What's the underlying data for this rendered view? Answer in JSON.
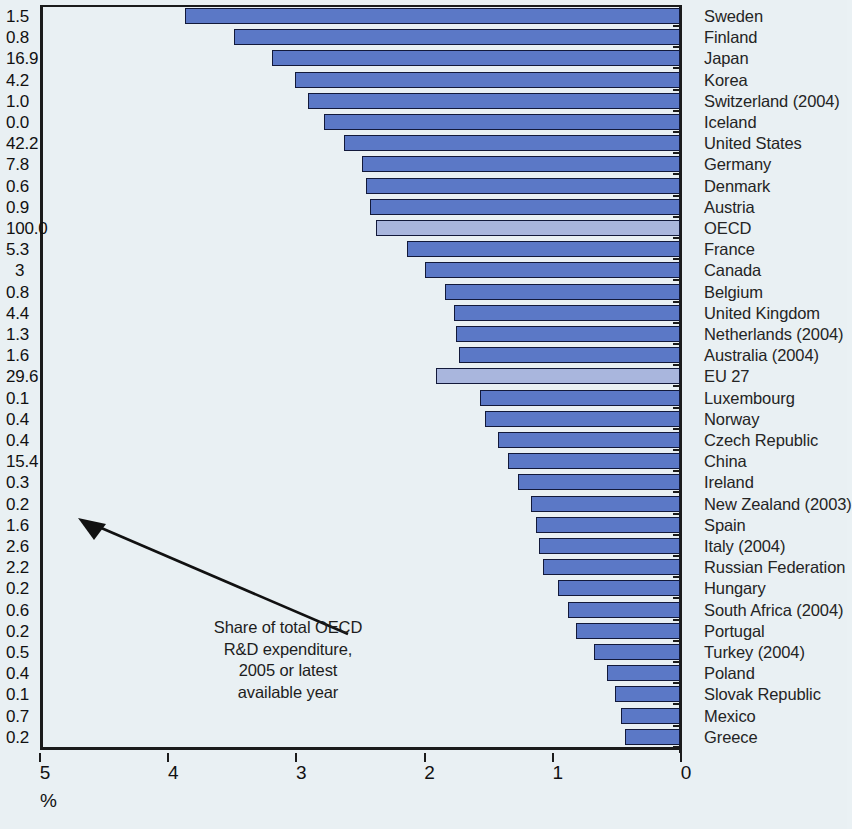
{
  "annotation": {
    "line1": "Share of total OECD",
    "line2": "R&D expenditure,",
    "line3": "2005 or latest",
    "line4": "available year"
  },
  "axis": {
    "unit": "%",
    "ticks": [
      "5",
      "4",
      "3",
      "2",
      "1",
      "0"
    ]
  },
  "colors": {
    "bar": "#5b78c6",
    "bar_aggregate": "#a9b6dd",
    "bar_border": "#12193a",
    "background": "#e9f0f3",
    "axis": "#1b1b1b"
  },
  "chart_data": {
    "type": "bar",
    "title": "",
    "subtitle": "",
    "xlabel": "%",
    "ylabel": "",
    "orientation": "horizontal",
    "xlim": [
      5,
      0
    ],
    "x_axis_reversed": true,
    "grid": false,
    "legend": null,
    "annotations": [
      "Share of total OECD R&D expenditure, 2005 or latest available year"
    ],
    "value_column_label": "Share of total OECD R&D expenditure",
    "categories": [
      "Sweden",
      "Finland",
      "Japan",
      "Korea",
      "Switzerland (2004)",
      "Iceland",
      "United States",
      "Germany",
      "Denmark",
      "Austria",
      "OECD",
      "France",
      "Canada",
      "Belgium",
      "United Kingdom",
      "Netherlands (2004)",
      "Australia (2004)",
      "EU 27",
      "Luxembourg",
      "Norway",
      "Czech Republic",
      "China",
      "Ireland",
      "New Zealand (2003)",
      "Spain",
      "Italy (2004)",
      "Russian Federation",
      "Hungary",
      "South Africa (2004)",
      "Portugal",
      "Turkey (2004)",
      "Poland",
      "Slovak Republic",
      "Mexico",
      "Greece"
    ],
    "series": [
      {
        "name": "R&D expenditure as % of GDP",
        "values": [
          3.86,
          3.48,
          3.18,
          3.0,
          2.9,
          2.78,
          2.62,
          2.48,
          2.45,
          2.42,
          2.37,
          2.13,
          1.99,
          1.83,
          1.76,
          1.75,
          1.72,
          1.9,
          1.56,
          1.52,
          1.42,
          1.34,
          1.26,
          1.16,
          1.12,
          1.1,
          1.07,
          0.95,
          0.87,
          0.81,
          0.67,
          0.57,
          0.51,
          0.46,
          0.43
        ]
      },
      {
        "name": "Share of total OECD R&D expenditure",
        "values": [
          "1.5",
          "0.8",
          "16.9",
          "4.2",
          "1.0",
          "0.0",
          "42.2",
          "7.8",
          "0.6",
          "0.9",
          "100.0",
          "5.3",
          "3",
          "0.8",
          "4.4",
          "1.3",
          "1.6",
          "29.6",
          "0.1",
          "0.4",
          "0.4",
          "15.4",
          "0.3",
          "0.2",
          "1.6",
          "2.6",
          "2.2",
          "0.2",
          "0.6",
          "0.2",
          "0.5",
          "0.4",
          "0.1",
          "0.7",
          "0.2"
        ]
      }
    ],
    "aggregate_rows": [
      "OECD",
      "EU 27"
    ]
  }
}
